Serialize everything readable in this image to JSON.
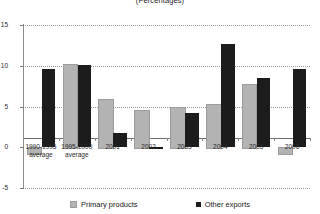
{
  "chart_data": {
    "type": "bar",
    "title": "(Percentages)",
    "xlabel": "",
    "ylabel": "",
    "ylim": [
      -5,
      15
    ],
    "yticks": [
      -5,
      0,
      5,
      10,
      15
    ],
    "ytick_labels": [
      "-5",
      "0",
      "5",
      "10",
      "15"
    ],
    "grid": true,
    "grid_style": "dotted-horizontal",
    "legend_position": "bottom",
    "categories": [
      "1990-1995\naverage",
      "1995-2000\naverage",
      "2001",
      "2002",
      "2003",
      "2004",
      "2005",
      "2006"
    ],
    "series": [
      {
        "name": "Primary products",
        "color": "#b3b3b3",
        "values": [
          -0.7,
          10.2,
          5.9,
          4.6,
          4.9,
          5.3,
          7.7,
          -0.7
        ]
      },
      {
        "name": "Other exports",
        "color": "#1c1c1c",
        "values": [
          9.6,
          10.1,
          1.8,
          -0.2,
          4.2,
          12.7,
          8.5,
          9.6
        ]
      }
    ]
  },
  "legend": {
    "items": [
      {
        "label": "Primary products",
        "swatch": "primary"
      },
      {
        "label": "Other exports",
        "swatch": "other"
      }
    ]
  }
}
